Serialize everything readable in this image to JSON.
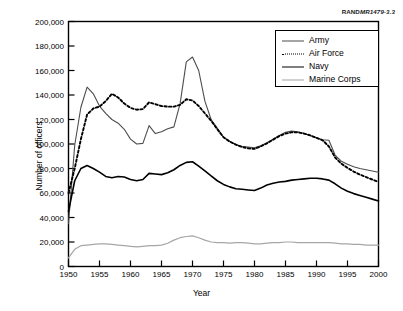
{
  "source_tag": {
    "prefix": "RAND",
    "italic": "MR1479-3.3"
  },
  "chart_data": {
    "type": "line",
    "title": "",
    "subtitle": "",
    "xlabel": "Year",
    "ylabel": "Number of officers",
    "xlim": [
      1950,
      2000
    ],
    "ylim": [
      0,
      200000
    ],
    "grid": false,
    "legend_position": "top-right",
    "xticks": [
      1950,
      1955,
      1960,
      1965,
      1970,
      1975,
      1980,
      1985,
      1990,
      1995,
      2000
    ],
    "xtick_labels": [
      "1950",
      "1955",
      "1960",
      "1965",
      "1970",
      "1975",
      "1980",
      "1985",
      "1990",
      "1995",
      "2000"
    ],
    "yticks": [
      0,
      20000,
      40000,
      60000,
      80000,
      100000,
      120000,
      140000,
      160000,
      180000,
      200000
    ],
    "ytick_labels": [
      "0",
      "20,000",
      "40,000",
      "60,000",
      "80,000",
      "100,000",
      "120,000",
      "140,000",
      "160,000",
      "180,000",
      "200,000"
    ],
    "x": [
      1950,
      1951,
      1952,
      1953,
      1954,
      1955,
      1956,
      1957,
      1958,
      1959,
      1960,
      1961,
      1962,
      1963,
      1964,
      1965,
      1966,
      1967,
      1968,
      1969,
      1970,
      1971,
      1972,
      1973,
      1974,
      1975,
      1976,
      1977,
      1978,
      1979,
      1980,
      1981,
      1982,
      1983,
      1984,
      1985,
      1986,
      1987,
      1988,
      1989,
      1990,
      1991,
      1992,
      1993,
      1994,
      1995,
      1996,
      1997,
      1998,
      1999,
      2000
    ],
    "series": [
      {
        "name": "Army",
        "color": "#4d4d4d",
        "style": "solid",
        "values": [
          35000,
          99000,
          130000,
          146500,
          141000,
          131000,
          125000,
          120000,
          117000,
          112000,
          104000,
          100000,
          100500,
          115000,
          108500,
          110000,
          112500,
          114000,
          133000,
          167000,
          171000,
          160000,
          135000,
          120000,
          113000,
          105500,
          102000,
          99500,
          98000,
          97500,
          97000,
          98500,
          101000,
          104000,
          107000,
          109500,
          110500,
          110000,
          108500,
          107000,
          105000,
          103500,
          103000,
          91000,
          86000,
          83500,
          81500,
          80000,
          79000,
          78000,
          77000
        ]
      },
      {
        "name": "Air Force",
        "color": "#000000",
        "style": "dotted",
        "values": [
          60000,
          80000,
          104000,
          124000,
          129000,
          130500,
          135000,
          141000,
          138000,
          133000,
          129500,
          128000,
          128500,
          134000,
          132500,
          131000,
          130500,
          130500,
          132000,
          136500,
          135500,
          131000,
          125000,
          119000,
          112000,
          105500,
          102000,
          99500,
          97500,
          96500,
          96000,
          98000,
          100500,
          103500,
          106500,
          108500,
          109500,
          109500,
          108500,
          107000,
          105000,
          103000,
          98000,
          89000,
          84000,
          80500,
          77500,
          75000,
          73000,
          71000,
          69000
        ]
      },
      {
        "name": "Navy",
        "color": "#000000",
        "style": "solid",
        "values": [
          45000,
          70000,
          80000,
          82500,
          80000,
          77000,
          73500,
          72500,
          73500,
          73000,
          71000,
          70000,
          71000,
          76000,
          75500,
          75000,
          76500,
          79000,
          82500,
          85000,
          85500,
          82000,
          78000,
          74000,
          70000,
          67000,
          65000,
          63500,
          63000,
          62500,
          62000,
          64000,
          66500,
          68000,
          69000,
          69500,
          70500,
          71000,
          71500,
          72000,
          72000,
          71500,
          70500,
          67500,
          64000,
          61500,
          59500,
          58000,
          56500,
          55000,
          53500
        ]
      },
      {
        "name": "Marine Corps",
        "color": "#a6a6a6",
        "style": "solid",
        "values": [
          7000,
          14000,
          17000,
          17500,
          18000,
          18500,
          18500,
          18000,
          17500,
          17000,
          16500,
          16000,
          16500,
          17000,
          17000,
          17500,
          19000,
          21500,
          23500,
          24500,
          25000,
          23500,
          21500,
          20000,
          19500,
          19500,
          19000,
          19500,
          19500,
          19000,
          18500,
          18500,
          19000,
          19500,
          19500,
          20000,
          20000,
          19500,
          19500,
          19500,
          19500,
          19500,
          19500,
          19000,
          18500,
          18500,
          18000,
          18000,
          17500,
          17500,
          17500
        ]
      }
    ]
  }
}
